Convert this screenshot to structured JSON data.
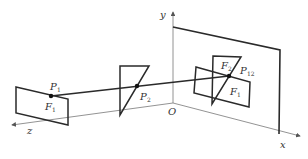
{
  "diagram": {
    "axes": {
      "x_label": "x",
      "y_label": "y",
      "z_label": "z",
      "origin_label": "O"
    },
    "points": [
      {
        "name": "P",
        "sub": "1"
      },
      {
        "name": "P",
        "sub": "2"
      },
      {
        "name": "P",
        "sub": "12"
      }
    ],
    "figures": [
      {
        "name": "F",
        "sub": "1",
        "where": "left rectangle"
      },
      {
        "name": "F",
        "sub": "2",
        "where": "projected triangle"
      },
      {
        "name": "F",
        "sub": "1",
        "where": "projected rectangle"
      }
    ],
    "colors": {
      "stroke": "#2a2a2a",
      "axis": "#6a6a6a",
      "text": "#333333"
    }
  }
}
